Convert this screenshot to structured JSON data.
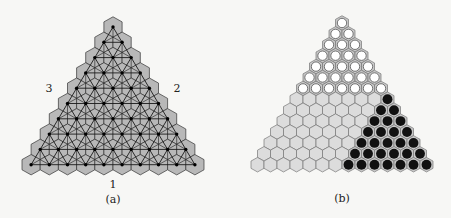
{
  "panel_a": {
    "caption": "(a)",
    "side_labels": {
      "bottom": "1",
      "right": "2",
      "left": "3"
    },
    "rows": 10,
    "top": [
      113,
      27
    ],
    "dx": 18.2,
    "dy": 15.3,
    "hex_fill": "#b8b8b8",
    "line_color": "#1a1a1a"
  },
  "panel_b": {
    "caption": "(b)",
    "rows": 14,
    "top": [
      342,
      23
    ],
    "dx": 13.0,
    "dy": 10.9,
    "white_rows": 7,
    "black_triangle_rows": 7,
    "cell_fill": "#dcdcdc",
    "white_color": "#ffffff",
    "black_color": "#111111"
  }
}
